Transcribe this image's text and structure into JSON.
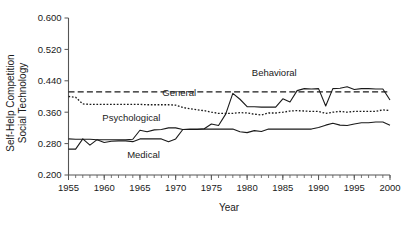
{
  "chart_data": {
    "type": "line",
    "title": "",
    "xlabel": "Year",
    "ylabel": "Self-Help Competition\nSocial Technology",
    "ylabel_line1": "Self-Help Competition",
    "ylabel_line2": "Social Technology",
    "xlim": [
      1955,
      2000
    ],
    "ylim": [
      0.2,
      0.6
    ],
    "grid": false,
    "legend_position": "inline-annotations",
    "xticks": [
      1955,
      1960,
      1965,
      1970,
      1975,
      1980,
      1985,
      1990,
      1995,
      2000
    ],
    "xtick_labels": [
      "1955",
      "1960",
      "1965",
      "1970",
      "1975",
      "1980",
      "1985",
      "1990",
      "1995",
      "2000"
    ],
    "x_minor_tick_interval": 1,
    "yticks": [
      0.2,
      0.28,
      0.36,
      0.44,
      0.52,
      0.6
    ],
    "ytick_labels": [
      "0.200",
      "0.280",
      "0.360",
      "0.440",
      "0.520",
      "0.600"
    ],
    "x": [
      1955,
      1956,
      1957,
      1958,
      1959,
      1960,
      1961,
      1962,
      1963,
      1964,
      1965,
      1966,
      1967,
      1968,
      1969,
      1970,
      1971,
      1972,
      1973,
      1974,
      1975,
      1976,
      1977,
      1978,
      1979,
      1980,
      1981,
      1982,
      1983,
      1984,
      1985,
      1986,
      1987,
      1988,
      1989,
      1990,
      1991,
      1992,
      1993,
      1994,
      1995,
      1996,
      1997,
      1998,
      1999,
      2000
    ],
    "series": [
      {
        "name": "Behavioral",
        "style": "dashed",
        "color": "#1a1a1a",
        "label_text": "Behavioral",
        "values": [
          0.412,
          0.412,
          0.412,
          0.412,
          0.412,
          0.412,
          0.412,
          0.412,
          0.412,
          0.412,
          0.412,
          0.412,
          0.412,
          0.412,
          0.412,
          0.412,
          0.412,
          0.412,
          0.412,
          0.412,
          0.412,
          0.412,
          0.412,
          0.412,
          0.412,
          0.412,
          0.412,
          0.412,
          0.412,
          0.412,
          0.412,
          0.412,
          0.412,
          0.412,
          0.412,
          0.412,
          0.412,
          0.412,
          0.412,
          0.412,
          0.412,
          0.412,
          0.412,
          0.412,
          0.412,
          0.412
        ]
      },
      {
        "name": "General",
        "style": "dotted",
        "color": "#1a1a1a",
        "label_text": "General",
        "values": [
          0.4,
          0.398,
          0.381,
          0.38,
          0.38,
          0.38,
          0.38,
          0.38,
          0.38,
          0.38,
          0.38,
          0.379,
          0.379,
          0.379,
          0.379,
          0.378,
          0.372,
          0.369,
          0.366,
          0.364,
          0.36,
          0.357,
          0.357,
          0.357,
          0.359,
          0.358,
          0.355,
          0.353,
          0.358,
          0.358,
          0.36,
          0.363,
          0.364,
          0.363,
          0.362,
          0.362,
          0.357,
          0.36,
          0.362,
          0.36,
          0.362,
          0.362,
          0.362,
          0.362,
          0.366,
          0.364
        ]
      },
      {
        "name": "Psychological",
        "style": "solid",
        "color": "#1a1a1a",
        "label_text": "Psychological",
        "values": [
          0.292,
          0.291,
          0.291,
          0.291,
          0.29,
          0.29,
          0.29,
          0.29,
          0.29,
          0.291,
          0.314,
          0.31,
          0.315,
          0.316,
          0.32,
          0.32,
          0.316,
          0.316,
          0.316,
          0.318,
          0.33,
          0.326,
          0.355,
          0.408,
          0.393,
          0.374,
          0.374,
          0.373,
          0.373,
          0.373,
          0.394,
          0.386,
          0.415,
          0.42,
          0.419,
          0.42,
          0.376,
          0.42,
          0.421,
          0.425,
          0.418,
          0.42,
          0.42,
          0.419,
          0.419,
          0.391
        ]
      },
      {
        "name": "Medical",
        "style": "solid",
        "color": "#1a1a1a",
        "label_text": "Medical",
        "values": [
          0.266,
          0.266,
          0.292,
          0.276,
          0.29,
          0.283,
          0.286,
          0.287,
          0.287,
          0.285,
          0.292,
          0.292,
          0.292,
          0.292,
          0.285,
          0.292,
          0.316,
          0.317,
          0.317,
          0.317,
          0.317,
          0.317,
          0.317,
          0.317,
          0.31,
          0.308,
          0.313,
          0.311,
          0.317,
          0.317,
          0.317,
          0.317,
          0.317,
          0.317,
          0.317,
          0.321,
          0.327,
          0.332,
          0.327,
          0.326,
          0.33,
          0.333,
          0.333,
          0.335,
          0.335,
          0.327
        ]
      }
    ],
    "annotations": [
      {
        "text": "Behavioral",
        "x": 1983.8,
        "y": 0.452
      },
      {
        "text": "General",
        "x": 1970.5,
        "y": 0.402
      },
      {
        "text": "Psychological",
        "x": 1963.8,
        "y": 0.338
      },
      {
        "text": "Medical",
        "x": 1965.5,
        "y": 0.243
      }
    ]
  }
}
